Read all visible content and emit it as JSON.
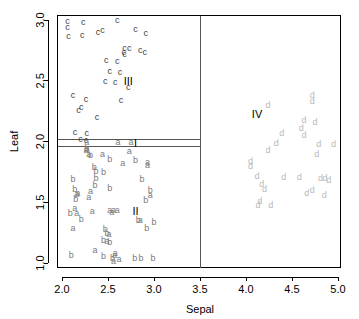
{
  "chart_data": {
    "type": "scatter",
    "title": "",
    "xlabel": "Sepal",
    "ylabel": "Leaf",
    "xlim": [
      1.9,
      5.1
    ],
    "ylim": [
      0.95,
      3.05
    ],
    "xticks": [
      2.0,
      2.5,
      3.0,
      3.5,
      4.0,
      4.5,
      5.0
    ],
    "xticklabels": [
      "2.0",
      "2.5",
      "3.0",
      "3.5",
      "4.0",
      "4.5",
      "5.0"
    ],
    "yticks": [
      1.0,
      1.5,
      2.0,
      2.5,
      3.0
    ],
    "yticklabels": [
      "1.0",
      "1.5",
      "2.0",
      "2.5",
      "3.0"
    ],
    "grid": false,
    "legend": "none",
    "partitions": {
      "vertical_x": [
        3.5
      ],
      "horizontal_y": [
        2.02,
        1.955
      ]
    },
    "region_labels": [
      {
        "text": "I",
        "x": 2.8,
        "y": 1.988
      },
      {
        "text": "II",
        "x": 2.8,
        "y": 1.43
      },
      {
        "text": "III",
        "x": 2.72,
        "y": 2.5
      },
      {
        "text": "IV",
        "x": 4.12,
        "y": 2.23
      }
    ],
    "series": [
      {
        "name": "c",
        "marker_text": "c",
        "color": "#3d3d3d",
        "points": [
          [
            2.06,
            2.99
          ],
          [
            2.23,
            2.98
          ],
          [
            2.06,
            2.94
          ],
          [
            2.6,
            3.0
          ],
          [
            2.44,
            2.92
          ],
          [
            2.8,
            2.93
          ],
          [
            2.07,
            2.87
          ],
          [
            2.22,
            2.88
          ],
          [
            2.39,
            2.9
          ],
          [
            2.91,
            2.89
          ],
          [
            2.68,
            2.77
          ],
          [
            2.73,
            2.77
          ],
          [
            2.67,
            2.74
          ],
          [
            2.85,
            2.75
          ],
          [
            2.9,
            2.74
          ],
          [
            2.48,
            2.67
          ],
          [
            2.6,
            2.66
          ],
          [
            2.68,
            2.72
          ],
          [
            2.52,
            2.58
          ],
          [
            2.63,
            2.57
          ],
          [
            2.47,
            2.5
          ],
          [
            2.58,
            2.49
          ],
          [
            2.72,
            2.45
          ],
          [
            2.12,
            2.38
          ],
          [
            2.26,
            2.35
          ],
          [
            2.64,
            2.34
          ],
          [
            2.21,
            2.28
          ],
          [
            2.18,
            2.26
          ],
          [
            2.38,
            2.2
          ],
          [
            2.14,
            2.08
          ],
          [
            2.27,
            2.07
          ],
          [
            2.2,
            2.02
          ],
          [
            2.26,
            2.01
          ]
        ]
      },
      {
        "name": "a",
        "marker_text": "a",
        "color": "#7a7a7a",
        "points": [
          [
            2.27,
            2.0
          ],
          [
            2.61,
            2.0
          ],
          [
            2.75,
            2.0
          ],
          [
            2.27,
            1.95
          ],
          [
            2.26,
            1.93
          ],
          [
            2.44,
            1.9
          ],
          [
            2.73,
            1.92
          ],
          [
            2.29,
            1.9
          ],
          [
            2.66,
            1.82
          ],
          [
            2.93,
            1.83
          ],
          [
            2.93,
            1.81
          ],
          [
            2.17,
            1.58
          ],
          [
            2.16,
            1.57
          ],
          [
            2.31,
            1.59
          ],
          [
            2.29,
            1.54
          ],
          [
            2.96,
            1.56
          ],
          [
            2.14,
            1.45
          ],
          [
            2.33,
            1.43
          ],
          [
            2.52,
            1.44
          ],
          [
            2.56,
            1.44
          ],
          [
            2.6,
            1.44
          ],
          [
            2.54,
            1.42
          ],
          [
            2.85,
            1.35
          ],
          [
            2.16,
            1.41
          ],
          [
            2.12,
            1.29
          ],
          [
            2.51,
            1.24
          ],
          [
            2.49,
            1.18
          ],
          [
            2.36,
            1.11
          ],
          [
            2.58,
            1.08
          ],
          [
            2.57,
            1.07
          ],
          [
            2.62,
            1.03
          ],
          [
            2.56,
            1.02
          ]
        ]
      },
      {
        "name": "b",
        "marker_text": "b",
        "color": "#7a7a7a",
        "points": [
          [
            2.27,
            1.94
          ],
          [
            2.31,
            1.89
          ],
          [
            2.52,
            1.86
          ],
          [
            2.8,
            1.85
          ],
          [
            2.35,
            1.79
          ],
          [
            2.37,
            1.76
          ],
          [
            2.45,
            1.75
          ],
          [
            2.12,
            1.69
          ],
          [
            2.87,
            1.69
          ],
          [
            2.37,
            1.7
          ],
          [
            2.14,
            1.61
          ],
          [
            2.96,
            1.6
          ],
          [
            2.36,
            1.64
          ],
          [
            2.52,
            1.62
          ],
          [
            2.15,
            1.53
          ],
          [
            2.91,
            1.52
          ],
          [
            2.09,
            1.41
          ],
          [
            2.21,
            1.36
          ],
          [
            2.83,
            1.35
          ],
          [
            3.0,
            1.34
          ],
          [
            2.92,
            1.29
          ],
          [
            2.47,
            1.28
          ],
          [
            2.49,
            1.25
          ],
          [
            2.45,
            1.19
          ],
          [
            2.52,
            1.17
          ],
          [
            2.1,
            1.07
          ],
          [
            2.45,
            1.06
          ],
          [
            2.55,
            1.04
          ],
          [
            2.79,
            1.04
          ],
          [
            2.86,
            1.04
          ],
          [
            2.99,
            1.04
          ]
        ]
      },
      {
        "name": "d",
        "marker_text": "d",
        "color": "#b8b8b8",
        "points": [
          [
            4.72,
            2.38
          ],
          [
            4.24,
            2.3
          ],
          [
            4.72,
            2.33
          ],
          [
            4.63,
            2.18
          ],
          [
            4.75,
            2.16
          ],
          [
            4.6,
            2.11
          ],
          [
            4.63,
            2.05
          ],
          [
            4.39,
            2.07
          ],
          [
            4.33,
            1.99
          ],
          [
            4.79,
            1.98
          ],
          [
            4.95,
            1.98
          ],
          [
            4.24,
            1.93
          ],
          [
            4.77,
            1.9
          ],
          [
            4.05,
            1.84
          ],
          [
            4.05,
            1.8
          ],
          [
            4.12,
            1.72
          ],
          [
            4.41,
            1.71
          ],
          [
            4.58,
            1.71
          ],
          [
            4.81,
            1.7
          ],
          [
            4.86,
            1.7
          ],
          [
            4.9,
            1.68
          ],
          [
            4.17,
            1.65
          ],
          [
            4.2,
            1.61
          ],
          [
            4.72,
            1.6
          ],
          [
            4.66,
            1.58
          ],
          [
            4.85,
            1.56
          ],
          [
            4.15,
            1.51
          ],
          [
            4.13,
            1.48
          ],
          [
            4.27,
            1.48
          ]
        ]
      }
    ]
  }
}
